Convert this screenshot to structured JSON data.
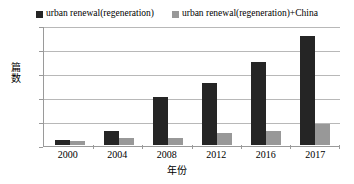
{
  "chart_data": {
    "type": "bar",
    "title": "",
    "categories": [
      "2000",
      "2004",
      "2008",
      "2012",
      "2016",
      "2017"
    ],
    "series": [
      {
        "name": "urban renewal(regeneration)",
        "color": "#252525",
        "values": [
          2,
          6,
          20,
          26,
          35,
          46
        ]
      },
      {
        "name": "urban renewal(regeneration)+China",
        "color": "#989898",
        "values": [
          1.5,
          3,
          3,
          5,
          6,
          9
        ]
      }
    ],
    "xlabel": "年份",
    "ylabel": "篇数",
    "ylim": [
      0,
      50
    ],
    "ytick_labels": [
      "50",
      "40",
      "30",
      "20",
      "10",
      "0"
    ],
    "ytick_values": [
      50,
      40,
      30,
      20,
      10,
      0
    ],
    "grid": true,
    "legend_position": "top"
  },
  "legend": {
    "entries": [
      {
        "label": "urban renewal(regeneration)",
        "swatch_color": "#252525"
      },
      {
        "label": "urban renewal(regeneration)+China",
        "swatch_color": "#989898"
      }
    ]
  },
  "axes": {
    "y_title": "篇数",
    "x_title": "年份"
  }
}
